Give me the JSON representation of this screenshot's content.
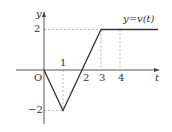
{
  "chart_data": {
    "type": "line",
    "title": "",
    "series": [
      {
        "name": "y=v(t)",
        "x": [
          0,
          1,
          2,
          3,
          4,
          6
        ],
        "values": [
          0,
          -2,
          0,
          2,
          2,
          2
        ]
      }
    ],
    "xlabel": "t",
    "ylabel": "y",
    "origin_label": "O",
    "x_ticks": [
      "1",
      "2",
      "3",
      "4"
    ],
    "y_ticks": [
      "2",
      "-2"
    ],
    "curve_label": "y=v(t)",
    "guides": [
      {
        "type": "vertical",
        "x": 1,
        "from_y": 0,
        "to_y": -2
      },
      {
        "type": "horizontal",
        "y": -2,
        "from_x": 0,
        "to_x": 1
      },
      {
        "type": "horizontal",
        "y": 2,
        "from_x": 0,
        "to_x": 3
      },
      {
        "type": "vertical",
        "x": 3,
        "from_y": 2,
        "to_y": 0
      },
      {
        "type": "vertical",
        "x": 4,
        "from_y": 2,
        "to_y": 0
      }
    ],
    "xlim": [
      -1.5,
      6.1
    ],
    "ylim": [
      -2.6,
      2.9
    ],
    "grid": false,
    "legend": "none"
  },
  "labels": {
    "y_axis": "y",
    "t_axis": "t",
    "origin": "O",
    "tick_1": "1",
    "tick_2": "2",
    "tick_3": "3",
    "tick_4": "4",
    "y_tick_pos": "2",
    "y_tick_neg": "−2",
    "curve": "y=v(t)"
  },
  "colors": {
    "axis": "#444444",
    "curve": "#333333",
    "guide": "#999999"
  }
}
